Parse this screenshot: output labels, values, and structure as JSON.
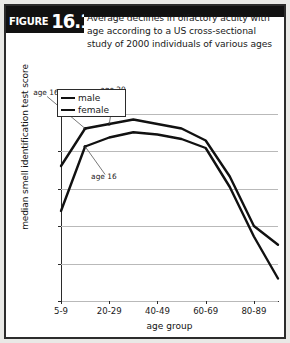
{
  "figure": {
    "tag_word": "FIGURE",
    "number": "16.10",
    "title": "Average declines in olfactory acuity with age according to a US cross-sectional study of 2000 individuals of various ages"
  },
  "colors": {
    "frame": "#2c2c2c",
    "banner": "#111111",
    "series": "#111111",
    "grid": "#b9b9b9",
    "axis": "#2b2b2b",
    "page_background": "#e9e9e6",
    "plot_background": "#ffffff"
  },
  "legend": {
    "position": "top-left-inside",
    "entries": [
      {
        "label": "male"
      },
      {
        "label": "female"
      }
    ]
  },
  "annotations": [
    {
      "text": "age 16",
      "target_series": "male"
    },
    {
      "text": "age 20",
      "target_series": "male"
    },
    {
      "text": "age 16",
      "target_series": "female"
    }
  ],
  "chart_data": {
    "type": "line",
    "title": "Average declines in olfactory acuity with age according to a US cross-sectional study of 2000 individuals of various ages",
    "xlabel": "age group",
    "ylabel": "median smell identification test score",
    "categories": [
      "5-9",
      "10-19",
      "20-29",
      "30-39",
      "40-49",
      "50-59",
      "60-69",
      "70-79",
      "80-89",
      "90-99"
    ],
    "tick_labels": [
      "5-9",
      "20-29",
      "40-49",
      "60-69",
      "80-89"
    ],
    "ytick_labels": [
      "15",
      "20",
      "25",
      "30",
      "35",
      "40"
    ],
    "ylim": [
      15,
      41
    ],
    "xlim": [
      0,
      9
    ],
    "grid": true,
    "series": [
      {
        "name": "male",
        "values": [
          33.0,
          38.0,
          38.6,
          39.2,
          38.6,
          38.0,
          36.4,
          31.6,
          25.0,
          22.5
        ]
      },
      {
        "name": "female",
        "values": [
          27.0,
          35.6,
          36.8,
          37.5,
          37.2,
          36.6,
          35.4,
          30.2,
          23.6,
          18.0
        ]
      }
    ],
    "annotated_points": [
      {
        "label": "age 16",
        "series": "male",
        "category_index": 1,
        "value": 38.0
      },
      {
        "label": "age 20",
        "series": "male",
        "category_index": 2,
        "value": 38.6
      },
      {
        "label": "age 16",
        "series": "female",
        "category_index": 1,
        "value": 35.6
      }
    ]
  }
}
